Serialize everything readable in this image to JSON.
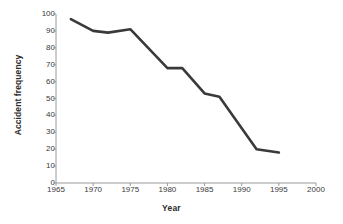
{
  "chart_data": {
    "type": "line",
    "title": "",
    "xlabel": "Year",
    "ylabel": "Accident frequency",
    "xlim": [
      1965,
      2000
    ],
    "ylim": [
      0,
      100
    ],
    "grid": false,
    "legend": "none",
    "line_color": "#3a3a3a",
    "x_ticks": [
      1965,
      1970,
      1975,
      1980,
      1985,
      1990,
      1995,
      2000
    ],
    "y_ticks": [
      0,
      10,
      20,
      30,
      40,
      50,
      60,
      70,
      80,
      90,
      100
    ],
    "series": [
      {
        "name": "Accident frequency",
        "x": [
          1967,
          1970,
          1972,
          1975,
          1980,
          1982,
          1985,
          1987,
          1992,
          1995
        ],
        "values": [
          97,
          90,
          89,
          91,
          68,
          68,
          53,
          51,
          20,
          18
        ]
      }
    ]
  }
}
